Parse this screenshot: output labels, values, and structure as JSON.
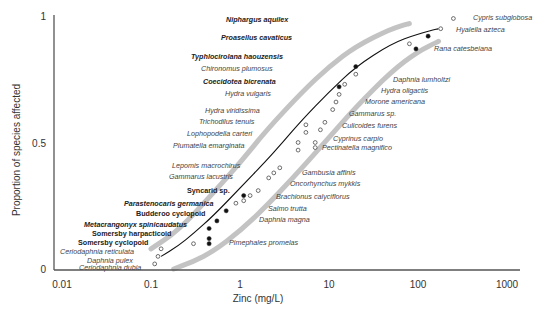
{
  "chart_data": {
    "type": "scatter",
    "title": "",
    "xlabel": "Zinc (mg/L)",
    "ylabel": "Proportion of species affected",
    "xscale": "log",
    "xlim": [
      0.01,
      1000
    ],
    "ylim": [
      0,
      1
    ],
    "x_ticks": [
      "0.01",
      "0.1",
      "1",
      "10",
      "100",
      "1000"
    ],
    "y_ticks": [
      "0",
      "0.5",
      "1"
    ],
    "grid": false,
    "legend": "none",
    "colors": {
      "axis": "#555555",
      "fit_curve": "#111111",
      "confidence_band": "#bdbdbd",
      "point_filled": "#111111",
      "point_open": "#ffffff",
      "point_stroke": "#333333"
    },
    "fit_curve": {
      "description": "Fitted species sensitivity distribution (log-normal), median ~3 mg/L",
      "points": [
        [
          0.13,
          0.05
        ],
        [
          0.2,
          0.09
        ],
        [
          0.3,
          0.14
        ],
        [
          0.5,
          0.21
        ],
        [
          1,
          0.32
        ],
        [
          2,
          0.43
        ],
        [
          3,
          0.5
        ],
        [
          5,
          0.59
        ],
        [
          10,
          0.7
        ],
        [
          20,
          0.8
        ],
        [
          50,
          0.89
        ],
        [
          100,
          0.93
        ],
        [
          170,
          0.95
        ]
      ]
    },
    "lower_band": {
      "points": [
        [
          0.18,
          0.0
        ],
        [
          0.3,
          0.03
        ],
        [
          0.5,
          0.07
        ],
        [
          1,
          0.15
        ],
        [
          2,
          0.25
        ],
        [
          5,
          0.4
        ],
        [
          10,
          0.52
        ],
        [
          20,
          0.64
        ],
        [
          50,
          0.78
        ],
        [
          100,
          0.86
        ],
        [
          170,
          0.9
        ]
      ]
    },
    "upper_band": {
      "points": [
        [
          0.1,
          0.08
        ],
        [
          0.2,
          0.15
        ],
        [
          0.5,
          0.3
        ],
        [
          1,
          0.42
        ],
        [
          2,
          0.55
        ],
        [
          5,
          0.7
        ],
        [
          10,
          0.8
        ],
        [
          20,
          0.88
        ],
        [
          50,
          0.95
        ],
        [
          80,
          0.97
        ]
      ]
    },
    "series": [
      {
        "name": "Stygofauna (filled)",
        "marker": "filled-circle",
        "points": [
          {
            "label": "Somersby cyclopoid",
            "x": 0.45,
            "y": 0.1
          },
          {
            "label": "Somersby harpacticoid",
            "x": 0.45,
            "y": 0.12
          },
          {
            "label": "Metacrangonyx spinicaudatus",
            "x": 0.45,
            "y": 0.16
          },
          {
            "label": "Budderoo cyclopoid",
            "x": 0.55,
            "y": 0.19
          },
          {
            "label": "Parastenocaris germanica",
            "x": 0.7,
            "y": 0.23
          },
          {
            "label": "Syncarid sp.",
            "x": 1.1,
            "y": 0.29
          },
          {
            "label": "Coecidotea bicrenata",
            "x": 13,
            "y": 0.72
          },
          {
            "label": "Typhlocirolana haouzensis",
            "x": 20,
            "y": 0.8
          },
          {
            "label": "Proasellus cavaticus",
            "x": 95,
            "y": 0.87
          },
          {
            "label": "Niphargus aquilex",
            "x": 130,
            "y": 0.92
          }
        ]
      },
      {
        "name": "Surface species (open)",
        "marker": "open-circle",
        "points": [
          {
            "label": "Ceriodaphnia dubia",
            "x": 0.11,
            "y": 0.02
          },
          {
            "label": "Daphnia pulex",
            "x": 0.12,
            "y": 0.05
          },
          {
            "label": "Ceriodaphnia reticulata",
            "x": 0.13,
            "y": 0.08
          },
          {
            "label": "Pimephales promelas",
            "x": 0.3,
            "y": 0.1
          },
          {
            "label": "Daphnia magna",
            "x": 0.9,
            "y": 0.26
          },
          {
            "label": "Salmo trutta",
            "x": 1.1,
            "y": 0.27
          },
          {
            "label": "Brachionus calyciflorus",
            "x": 1.3,
            "y": 0.29
          },
          {
            "label": "Oncorhynchus mykkis",
            "x": 1.6,
            "y": 0.31
          },
          {
            "label": "Gambusia affinis",
            "x": 2.1,
            "y": 0.36
          },
          {
            "label": "Gammarus lacustris",
            "x": 2.4,
            "y": 0.38
          },
          {
            "label": "Lepomis macrochirus",
            "x": 2.8,
            "y": 0.4
          },
          {
            "label": "Plumatella emarginata",
            "x": 4.5,
            "y": 0.47
          },
          {
            "label": "Lophopodella carteri",
            "x": 4.5,
            "y": 0.5
          },
          {
            "label": "Trichodilus tenuis",
            "x": 5.5,
            "y": 0.54
          },
          {
            "label": "Hydra viridissima",
            "x": 5.5,
            "y": 0.57
          },
          {
            "label": "Pectinatella magnifica",
            "x": 7,
            "y": 0.48
          },
          {
            "label": "Cyprinus carpio",
            "x": 7,
            "y": 0.5
          },
          {
            "label": "Culicoides furens",
            "x": 8,
            "y": 0.55
          },
          {
            "label": "Gammarus sp.",
            "x": 9,
            "y": 0.58
          },
          {
            "label": "Morone americana",
            "x": 11,
            "y": 0.63
          },
          {
            "label": "Hydra oligactis",
            "x": 12,
            "y": 0.66
          },
          {
            "label": "Hydra vulgaris",
            "x": 13,
            "y": 0.69
          },
          {
            "label": "Daphnia lumholtzi",
            "x": 15,
            "y": 0.73
          },
          {
            "label": "Chironomus plumosus",
            "x": 20,
            "y": 0.77
          },
          {
            "label": "Rana catesbeiana",
            "x": 80,
            "y": 0.89
          },
          {
            "label": "Hyalella azteca",
            "x": 180,
            "y": 0.95
          },
          {
            "label": "Cypris subglobosa",
            "x": 250,
            "y": 0.99
          }
        ]
      }
    ],
    "annotations": [
      {
        "text": "Niphargus aquilex",
        "bold": true,
        "x": 226,
        "y": 22
      },
      {
        "text": "Proasellus cavaticus",
        "bold": true,
        "x": 221,
        "y": 40
      },
      {
        "text": "Typhlocirolana haouzensis",
        "bold": true,
        "x": 191,
        "y": 59
      },
      {
        "text": "Chironomus plumosus",
        "bold": false,
        "x": 201,
        "y": 71
      },
      {
        "text": "Coecidotea bicrenata",
        "bold": true,
        "x": 203,
        "y": 84
      },
      {
        "text": "Hydra vulgaris",
        "bold": false,
        "x": 225,
        "y": 96
      },
      {
        "text": "Hydra viridissima",
        "bold": false,
        "x": 205,
        "y": 113
      },
      {
        "text": "Trichodilus tenuis",
        "bold": false,
        "x": 199,
        "y": 124
      },
      {
        "text": "Lophopodella carteri",
        "bold": false,
        "x": 187,
        "y": 136
      },
      {
        "text": "Plumatella emarginata",
        "bold": false,
        "x": 173,
        "y": 148
      },
      {
        "text": "Lepomis macrochirus",
        "bold": false,
        "x": 172,
        "y": 168
      },
      {
        "text": "Gammarus lacustris",
        "bold": false,
        "x": 169,
        "y": 179
      },
      {
        "text": "Syncarid sp.",
        "bold": true,
        "upright": true,
        "x": 187,
        "y": 193
      },
      {
        "text": "Parastenocaris germanica",
        "bold": true,
        "x": 124,
        "y": 206
      },
      {
        "text": "Budderoo cyclopoid",
        "bold": true,
        "upright": true,
        "x": 136,
        "y": 216
      },
      {
        "text": "Metacrangonyx spinicaudatus",
        "bold": true,
        "x": 84,
        "y": 227
      },
      {
        "text": "Somersby harpacticoid",
        "bold": true,
        "upright": true,
        "x": 92,
        "y": 236
      },
      {
        "text": "Somersby cyclopoid",
        "bold": true,
        "upright": true,
        "x": 78,
        "y": 245
      },
      {
        "text": "Ceriodaphnia reticulata",
        "bold": false,
        "x": 60,
        "y": 254
      },
      {
        "text": "Daphnia pulex",
        "bold": false,
        "x": 87,
        "y": 263
      },
      {
        "text": "Ceriodaphnia dubia",
        "bold": false,
        "x": 79,
        "y": 270
      },
      {
        "text": "Daphnia lumholtzi",
        "bold": false,
        "x": 393,
        "y": 82
      },
      {
        "text": "Hydra oligactis",
        "bold": false,
        "x": 381,
        "y": 93
      },
      {
        "text": "Morone americana",
        "bold": false,
        "x": 365,
        "y": 104
      },
      {
        "text": "Gammarus sp.",
        "bold": false,
        "x": 349,
        "y": 116
      },
      {
        "text": "Culicoides furens",
        "bold": false,
        "x": 342,
        "y": 128
      },
      {
        "text": "Cyprinus carpio",
        "bold": false,
        "x": 333,
        "y": 141
      },
      {
        "text": "Pectinatella magnifico",
        "bold": false,
        "x": 322,
        "y": 150
      },
      {
        "text": "Gambusia affinis",
        "bold": false,
        "x": 302,
        "y": 175
      },
      {
        "text": "Oncorhynchus mykkis",
        "bold": false,
        "x": 290,
        "y": 186
      },
      {
        "text": "Brachionus calyciflorus",
        "bold": false,
        "x": 276,
        "y": 199
      },
      {
        "text": "Salmo trutta",
        "bold": false,
        "x": 268,
        "y": 211
      },
      {
        "text": "Daphnia magna",
        "bold": false,
        "x": 259,
        "y": 222
      },
      {
        "text": "Pimephales promelas",
        "bold": false,
        "x": 229,
        "y": 245
      },
      {
        "text": "Cypris subglobosa",
        "bold": false,
        "x": 473,
        "y": 20
      },
      {
        "text": "Hyalella azteca",
        "bold": false,
        "x": 456,
        "y": 32
      },
      {
        "text": "Rana catesbeiana",
        "bold": false,
        "x": 434,
        "y": 51
      }
    ]
  }
}
